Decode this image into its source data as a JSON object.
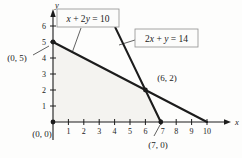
{
  "figure": {
    "background": "#fdfdfc",
    "line_color": "#1c1c1c",
    "shade_color": "#f4f3f0",
    "box_border_color": "#8f8f8f",
    "box_fill": "#fcfcfb"
  },
  "chart_data": {
    "type": "line",
    "title": "",
    "xlabel": "x",
    "ylabel": "y",
    "xlim": [
      0,
      11.2
    ],
    "ylim": [
      0,
      6.9
    ],
    "x_ticks": [
      1,
      2,
      3,
      4,
      5,
      6,
      7,
      8,
      9,
      10
    ],
    "y_ticks": [
      1,
      2,
      3,
      4,
      5,
      6
    ],
    "grid": false,
    "legend_position": "boxed callouts with leader lines",
    "series": [
      {
        "name": "x + 2y = 10",
        "points": [
          [
            0,
            5
          ],
          [
            10,
            0
          ]
        ],
        "label_box": {
          "text": "x + 2y = 10",
          "px": [
            57,
            9,
            62,
            18
          ],
          "leader": [
            [
              81,
              28
            ],
            [
              72,
              53
            ]
          ]
        }
      },
      {
        "name": "2x + y = 14",
        "points": [
          [
            4.05,
            5.9
          ],
          [
            7,
            0
          ]
        ],
        "label_box": {
          "text": "2x + y = 14",
          "px": [
            135,
            29,
            63,
            18
          ],
          "leader": [
            [
              135,
              40
            ],
            [
              119,
              45
            ]
          ]
        }
      }
    ],
    "marked_points": [
      {
        "coords": [
          0,
          5
        ],
        "label": "(0, 5)",
        "label_px": [
          17,
          61
        ],
        "leader": [
          [
            33,
            55
          ],
          [
            49,
            46
          ]
        ]
      },
      {
        "coords": [
          0,
          0
        ],
        "label": "(0, 0)",
        "label_px": [
          42,
          137
        ],
        "leader": null
      },
      {
        "coords": [
          6,
          2
        ],
        "label": "(6, 2)",
        "label_px": [
          167,
          81
        ],
        "leader": null
      },
      {
        "coords": [
          7,
          0
        ],
        "label": "(7, 0)",
        "label_px": [
          158,
          148
        ],
        "leader": [
          [
            154,
            136
          ],
          [
            160,
            125
          ]
        ]
      }
    ],
    "shaded_region": {
      "vertices": [
        [
          0,
          0
        ],
        [
          7,
          0
        ],
        [
          6,
          2
        ],
        [
          0,
          5
        ]
      ]
    }
  }
}
